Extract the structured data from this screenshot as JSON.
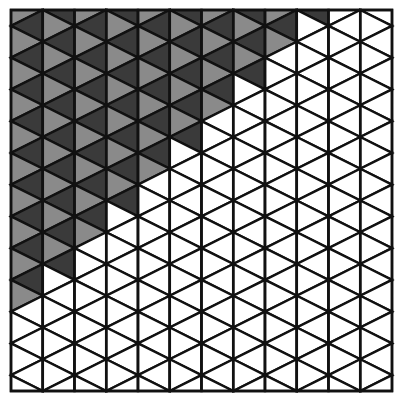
{
  "puzzle": {
    "type": "triangle-strip-grid",
    "columns": 12,
    "triangles_per_column": 25,
    "frame": {
      "x": 11,
      "y": 10,
      "width": 381,
      "height": 381
    },
    "filled_triangles_per_column": [
      19,
      17,
      15,
      13,
      11,
      9,
      7,
      5,
      3,
      1,
      0,
      0
    ],
    "colors": {
      "light": "#8a8a8a",
      "dark": "#3a3a3a",
      "empty": "#ffffff",
      "stroke": "#111111"
    }
  }
}
